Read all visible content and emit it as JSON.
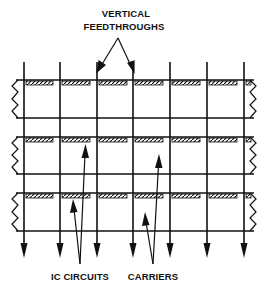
{
  "diagram": {
    "title_lines": [
      "VERTICAL",
      "FEEDTHROUGHS"
    ],
    "labels": {
      "ic_circuits": "IC CIRCUITS",
      "carriers": "CARRIERS"
    },
    "colors": {
      "ink": "#111111",
      "background": "#ffffff"
    },
    "carrier_count": 3,
    "chips_per_carrier": 6,
    "vertical_feedthrough_count": 7,
    "legend": [
      {
        "name": "vertical-feedthrough",
        "meaning": "vertical lines passing down through all carriers, ending in arrowheads"
      },
      {
        "name": "carrier",
        "meaning": "horizontal strip bounded by zigzag break lines at both ends"
      },
      {
        "name": "ic-circuit",
        "meaning": "hatched block mounted on top edge of each carrier"
      }
    ]
  }
}
